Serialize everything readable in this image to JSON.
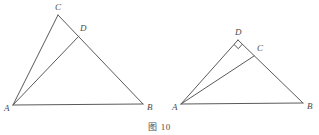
{
  "caption": {
    "text": "图 10"
  },
  "colors": {
    "stroke": "#5a5a5a",
    "label": "#4a4a4a",
    "background": "#ffffff"
  },
  "figures": [
    {
      "id": "left-figure",
      "name": "triangle-abc-with-altitude-ad",
      "points": {
        "A": {
          "label": "A",
          "x": 13,
          "y": 105,
          "label_x": 4,
          "label_y": 111
        },
        "B": {
          "label": "B",
          "x": 143,
          "y": 104,
          "label_x": 147,
          "label_y": 110
        },
        "C": {
          "label": "C",
          "x": 58,
          "y": 15,
          "label_x": 55,
          "label_y": 10
        },
        "D": {
          "label": "D",
          "x": 79,
          "y": 36,
          "label_x": 80,
          "label_y": 31
        }
      },
      "segments": [
        {
          "name": "segment-AB",
          "from": "A",
          "to": "B"
        },
        {
          "name": "segment-AC",
          "from": "A",
          "to": "C"
        },
        {
          "name": "segment-CB",
          "from": "C",
          "to": "B"
        },
        {
          "name": "segment-AD",
          "from": "A",
          "to": "D"
        }
      ],
      "right_angle": {
        "name": "right-angle-marker-at-D",
        "at": "D",
        "size": 6
      }
    },
    {
      "id": "right-figure",
      "name": "triangle-abd-with-cevian-ac",
      "points": {
        "A": {
          "label": "A",
          "x": 181,
          "y": 104,
          "label_x": 172,
          "label_y": 110
        },
        "B": {
          "label": "B",
          "x": 303,
          "y": 103,
          "label_x": 307,
          "label_y": 109
        },
        "C": {
          "label": "C",
          "x": 254,
          "y": 56,
          "label_x": 257,
          "label_y": 51
        },
        "D": {
          "label": "D",
          "x": 238,
          "y": 40,
          "label_x": 235,
          "label_y": 35
        }
      },
      "segments": [
        {
          "name": "segment-AB",
          "from": "A",
          "to": "B"
        },
        {
          "name": "segment-AD",
          "from": "A",
          "to": "D"
        },
        {
          "name": "segment-DB",
          "from": "D",
          "to": "B"
        },
        {
          "name": "segment-AC",
          "from": "A",
          "to": "C"
        }
      ],
      "right_angle": {
        "name": "right-angle-marker-at-D",
        "at": "D",
        "size": 6
      }
    }
  ]
}
